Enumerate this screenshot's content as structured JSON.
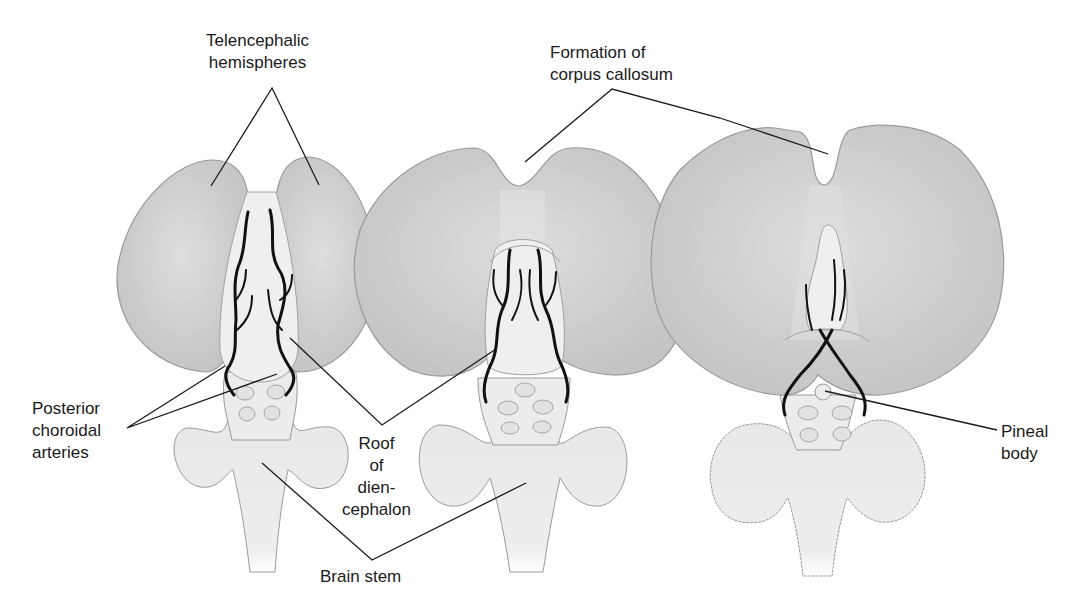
{
  "diagram": {
    "type": "anatomical-illustration",
    "colors": {
      "hemisphere_fill": "#c9c9c9",
      "hemisphere_highlight": "#dedede",
      "brainstem_fill": "#ececec",
      "outline": "#8a8a8a",
      "vessel": "#111111",
      "leader_line": "#1a1a1a"
    },
    "stages": [
      {
        "id": "early",
        "features": [
          "telencephalic hemispheres separated",
          "roof of diencephalon exposed",
          "posterior choroidal arteries"
        ]
      },
      {
        "id": "middle",
        "features": [
          "corpus callosum forming",
          "roof of diencephalon partly covered"
        ]
      },
      {
        "id": "late",
        "features": [
          "large hemispheres with corpus callosum",
          "pineal body visible",
          "cerebellum lobes wrinkled"
        ]
      }
    ],
    "labels": {
      "telencephalic": "Telencephalic\nhemispheres",
      "corpus_callosum": "Formation of\ncorpus callosum",
      "posterior_choroidal": "Posterior\nchoroidal\narteries",
      "roof_diencephalon": "Roof\nof\ndien-\ncephalon",
      "brain_stem": "Brain stem",
      "pineal": "Pineal\nbody"
    }
  }
}
